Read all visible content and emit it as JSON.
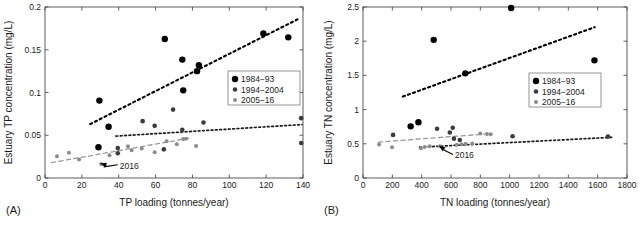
{
  "figure": {
    "panel_a_label": "(A)",
    "panel_b_label": "(B)"
  },
  "chart_data": [
    {
      "id": "panel-a",
      "type": "scatter",
      "title": "",
      "xlabel": "TP loading (tonnes/year)",
      "ylabel": "Estuary TP concentration (mg/L)",
      "xlim": [
        0,
        140
      ],
      "ylim": [
        0,
        0.2
      ],
      "xticks": [
        0,
        20,
        40,
        60,
        80,
        100,
        120,
        140
      ],
      "yticks": [
        0,
        0.05,
        0.1,
        0.15,
        0.2
      ],
      "xticklabels": [
        "0",
        "20",
        "40",
        "60",
        "80",
        "100",
        "120",
        "140"
      ],
      "yticklabels": [
        "0",
        "0.05",
        "0.1",
        "0.15",
        "0.2"
      ],
      "grid": false,
      "legend_position": "right-middle",
      "panel_label": "(A)",
      "annotation": {
        "text": "2016",
        "x": 40,
        "y": 0.012,
        "arrow_to_x": 30.5,
        "arrow_to_y": 0.0165
      },
      "series": [
        {
          "name": "1984-93",
          "marker": "filled-circle",
          "color": "#000000",
          "size": 3.2,
          "points": [
            {
              "x": 29.5,
              "y": 0.0905
            },
            {
              "x": 34.5,
              "y": 0.06
            },
            {
              "x": 65.0,
              "y": 0.1625
            },
            {
              "x": 74.5,
              "y": 0.1385
            },
            {
              "x": 75.0,
              "y": 0.1025
            },
            {
              "x": 82.5,
              "y": 0.125
            },
            {
              "x": 83.5,
              "y": 0.132
            },
            {
              "x": 118.5,
              "y": 0.169
            },
            {
              "x": 132.0,
              "y": 0.1645
            },
            {
              "x": 29.0,
              "y": 0.036
            }
          ]
        },
        {
          "name": "1994-2004",
          "marker": "filled-circle",
          "color": "#3b3b3b",
          "size": 2.3,
          "points": [
            {
              "x": 39.5,
              "y": 0.035
            },
            {
              "x": 39.5,
              "y": 0.029
            },
            {
              "x": 53.0,
              "y": 0.0665
            },
            {
              "x": 59.5,
              "y": 0.061
            },
            {
              "x": 64.5,
              "y": 0.0335
            },
            {
              "x": 69.5,
              "y": 0.08
            },
            {
              "x": 74.5,
              "y": 0.0565
            },
            {
              "x": 86.0,
              "y": 0.065
            },
            {
              "x": 139.0,
              "y": 0.07
            },
            {
              "x": 139.0,
              "y": 0.041
            }
          ]
        },
        {
          "name": "2005-16",
          "marker": "filled-circle",
          "color": "#8c8c8c",
          "size": 2.0,
          "points": [
            {
              "x": 6.5,
              "y": 0.0255
            },
            {
              "x": 13.0,
              "y": 0.0295
            },
            {
              "x": 18.5,
              "y": 0.0215
            },
            {
              "x": 30.5,
              "y": 0.0165
            },
            {
              "x": 35.0,
              "y": 0.0265
            },
            {
              "x": 45.0,
              "y": 0.037
            },
            {
              "x": 47.0,
              "y": 0.0325
            },
            {
              "x": 52.5,
              "y": 0.0345
            },
            {
              "x": 59.5,
              "y": 0.03
            },
            {
              "x": 66.0,
              "y": 0.043
            },
            {
              "x": 71.5,
              "y": 0.0395
            },
            {
              "x": 75.0,
              "y": 0.0455
            },
            {
              "x": 76.5,
              "y": 0.046
            },
            {
              "x": 82.0,
              "y": 0.0375
            }
          ]
        }
      ],
      "trendlines": [
        {
          "name": "1984-93-trend",
          "style": "dotted",
          "color": "#000000",
          "width": 2.1,
          "x1": 24.5,
          "y1": 0.063,
          "x2": 137.0,
          "y2": 0.1855
        },
        {
          "name": "1994-2004-trend",
          "style": "dotted",
          "color": "#1a1a1a",
          "width": 1.7,
          "x1": 38.5,
          "y1": 0.049,
          "x2": 139.5,
          "y2": 0.0625
        },
        {
          "name": "2005-16-trend",
          "style": "dashed",
          "color": "#9a9a9a",
          "width": 1.3,
          "x1": 3.5,
          "y1": 0.018,
          "x2": 78.0,
          "y2": 0.0465
        }
      ],
      "legend": [
        "1984−93",
        "1994−2004",
        "2005−16"
      ]
    },
    {
      "id": "panel-b",
      "type": "scatter",
      "title": "",
      "xlabel": "TN loading (tonnes/year)",
      "ylabel": "Estuary TN concentration (mg/L)",
      "xlim": [
        0,
        1800
      ],
      "ylim": [
        0,
        2.5
      ],
      "xticks": [
        0,
        200,
        400,
        600,
        800,
        1000,
        1200,
        1400,
        1600,
        1800
      ],
      "yticks": [
        0,
        0.5,
        1,
        1.5,
        2,
        2.5
      ],
      "xticklabels": [
        "0",
        "200",
        "400",
        "600",
        "800",
        "1000",
        "1200",
        "1400",
        "1600",
        "1800"
      ],
      "yticklabels": [
        "0",
        "0.5",
        "1",
        "1.5",
        "2",
        "2.5"
      ],
      "grid": false,
      "legend_position": "right-middle",
      "panel_label": "(B)",
      "annotation": {
        "text": "2016",
        "x": 620,
        "y": 0.3,
        "arrow_to_x": 525,
        "arrow_to_y": 0.465
      },
      "series": [
        {
          "name": "1984-93",
          "marker": "filled-circle",
          "color": "#000000",
          "size": 3.2,
          "points": [
            {
              "x": 325,
              "y": 0.755
            },
            {
              "x": 378,
              "y": 0.815
            },
            {
              "x": 482,
              "y": 2.02
            },
            {
              "x": 698,
              "y": 1.53
            },
            {
              "x": 1010,
              "y": 2.485
            },
            {
              "x": 1578,
              "y": 1.72
            }
          ]
        },
        {
          "name": "1994-2004",
          "marker": "filled-circle",
          "color": "#3b3b3b",
          "size": 2.3,
          "points": [
            {
              "x": 205,
              "y": 0.63
            },
            {
              "x": 505,
              "y": 0.72
            },
            {
              "x": 592,
              "y": 0.665
            },
            {
              "x": 612,
              "y": 0.735
            },
            {
              "x": 620,
              "y": 0.575
            },
            {
              "x": 660,
              "y": 0.555
            },
            {
              "x": 1020,
              "y": 0.61
            },
            {
              "x": 1670,
              "y": 0.605
            }
          ]
        },
        {
          "name": "2005-16",
          "marker": "filled-circle",
          "color": "#8c8c8c",
          "size": 2.0,
          "points": [
            {
              "x": 110,
              "y": 0.49
            },
            {
              "x": 198,
              "y": 0.45
            },
            {
              "x": 395,
              "y": 0.435
            },
            {
              "x": 420,
              "y": 0.455
            },
            {
              "x": 455,
              "y": 0.465
            },
            {
              "x": 525,
              "y": 0.465
            },
            {
              "x": 640,
              "y": 0.485
            },
            {
              "x": 672,
              "y": 0.495
            },
            {
              "x": 700,
              "y": 0.5
            },
            {
              "x": 745,
              "y": 0.505
            },
            {
              "x": 800,
              "y": 0.65
            },
            {
              "x": 845,
              "y": 0.645
            },
            {
              "x": 870,
              "y": 0.64
            }
          ]
        }
      ],
      "trendlines": [
        {
          "name": "1984-93-trend",
          "style": "dotted",
          "color": "#000000",
          "width": 2.1,
          "x1": 272,
          "y1": 1.19,
          "x2": 1580,
          "y2": 2.205
        },
        {
          "name": "1994-2004-trend",
          "style": "dashed",
          "color": "#9a9a9a",
          "width": 1.3,
          "x1": 105,
          "y1": 0.525,
          "x2": 880,
          "y2": 0.65
        },
        {
          "name": "2005-16-trend",
          "style": "dotted",
          "color": "#1a1a1a",
          "width": 1.7,
          "x1": 385,
          "y1": 0.45,
          "x2": 1700,
          "y2": 0.595
        }
      ],
      "legend": [
        "1984−93",
        "1994−2004",
        "2005−16"
      ]
    }
  ]
}
